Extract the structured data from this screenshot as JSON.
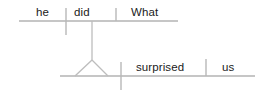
{
  "diagram": {
    "type": "reed-kellogg-sentence-diagram",
    "sentence": "What he did surprised us",
    "stroke_color": "#b3b3b3",
    "text_color": "#1a1a1a",
    "background_color": "#ffffff",
    "clauses": [
      {
        "name": "subordinate-clause",
        "baseline": {
          "x1": 19,
          "y1": 21,
          "x2": 178,
          "y2": 21
        },
        "words": [
          {
            "role": "subject",
            "text": "he"
          },
          {
            "role": "verb",
            "text": "did"
          },
          {
            "role": "direct-object",
            "text": "What"
          }
        ],
        "dividers": [
          {
            "name": "subject-verb-divider",
            "x": 66,
            "y1": 8,
            "y2": 35,
            "crosses_baseline": true
          },
          {
            "name": "verb-object-divider",
            "x": 116,
            "y1": 8,
            "y2": 21,
            "crosses_baseline": false
          }
        ]
      },
      {
        "name": "main-clause",
        "baseline": {
          "x1": 60,
          "y1": 76,
          "x2": 255,
          "y2": 76
        },
        "words": [
          {
            "role": "subject",
            "text": ""
          },
          {
            "role": "verb",
            "text": "surprised"
          },
          {
            "role": "direct-object",
            "text": "us"
          }
        ],
        "dividers": [
          {
            "name": "subject-verb-divider",
            "x": 121,
            "y1": 62,
            "y2": 90,
            "crosses_baseline": true
          },
          {
            "name": "verb-object-divider",
            "x": 206,
            "y1": 59,
            "y2": 76,
            "crosses_baseline": false
          }
        ]
      }
    ],
    "connector": {
      "name": "noun-clause-stem",
      "stem": {
        "x1": 92,
        "y1": 21,
        "x2": 92,
        "y2": 60
      },
      "tripod": {
        "apex": {
          "x": 92,
          "y": 60
        },
        "left_foot": {
          "x": 75,
          "y": 76
        },
        "right_foot": {
          "x": 108,
          "y": 76
        }
      }
    }
  },
  "labels": {
    "he": "he",
    "did": "did",
    "what": "What",
    "surprised": "surprised",
    "us": "us"
  }
}
